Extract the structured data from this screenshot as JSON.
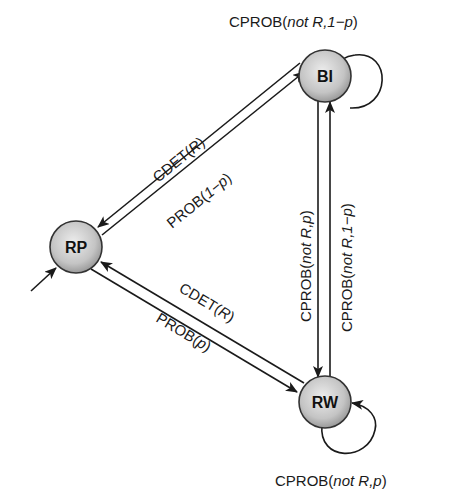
{
  "diagram": {
    "type": "state-machine",
    "nodes": [
      {
        "id": "BI",
        "label": "BI"
      },
      {
        "id": "RP",
        "label": "RP",
        "initial": true
      },
      {
        "id": "RW",
        "label": "RW"
      }
    ],
    "edges": {
      "bi_self": {
        "from": "BI",
        "to": "BI",
        "label_pre": "CPROB(",
        "label_it": "not R,1−p",
        "label_post": ")"
      },
      "bi_to_rp": {
        "from": "BI",
        "to": "RP",
        "label_pre": "CDET(",
        "label_it": "R",
        "label_post": ")"
      },
      "rp_to_bi": {
        "from": "RP",
        "to": "BI",
        "label_pre": "PROB(",
        "label_it": "1−p",
        "label_post": ")"
      },
      "bi_to_rw": {
        "from": "BI",
        "to": "RW",
        "label_pre": "CPROB(",
        "label_it": "not R,p",
        "label_post": ")"
      },
      "rw_to_bi": {
        "from": "RW",
        "to": "BI",
        "label_pre": "CPROB(",
        "label_it": "not R,1−p",
        "label_post": ")"
      },
      "rw_to_rp": {
        "from": "RW",
        "to": "RP",
        "label_pre": "CDET(",
        "label_it": "R",
        "label_post": ")"
      },
      "rp_to_rw": {
        "from": "RP",
        "to": "RW",
        "label_pre": "PROB(",
        "label_it": "p",
        "label_post": ")"
      },
      "rw_self": {
        "from": "RW",
        "to": "RW",
        "label_pre": "CPROB(",
        "label_it": "not R,p",
        "label_post": ")"
      }
    }
  }
}
